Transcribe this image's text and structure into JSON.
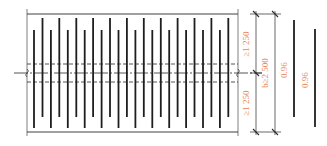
{
  "diagram": {
    "colors": {
      "line": "#2a2a2a",
      "bar": "#1e1e1e",
      "dimension_text": "#e8875a",
      "background": "#ffffff"
    },
    "frame": {
      "left": 27,
      "right": 238,
      "top": 14,
      "bottom": 132
    },
    "center_line_y": 73,
    "dashed_lines_y": [
      64,
      82
    ],
    "bars": {
      "count": 24,
      "start_x": 34,
      "spacing": 8.45,
      "short_group": {
        "y_top": 30,
        "y_bottom": 128
      },
      "tall_group": {
        "y_top": 18,
        "y_bottom": 117
      }
    },
    "dimensions": {
      "upper_label": "≥1 250",
      "lower_label": "≥1 250",
      "total_label": "b≥2 500",
      "bar_length_label_1": "0.96",
      "bar_length_label_2": "0.96"
    },
    "legend_bars": [
      {
        "x": 294,
        "y_top": 20,
        "y_bottom": 117
      },
      {
        "x": 315,
        "y_top": 29,
        "y_bottom": 127
      }
    ]
  }
}
